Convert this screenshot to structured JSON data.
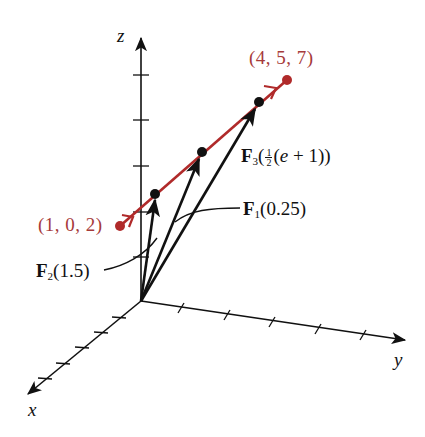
{
  "axes": {
    "x_label": "x",
    "y_label": "y",
    "z_label": "z"
  },
  "points": {
    "start": {
      "label": "(1, 0, 2)",
      "coords": [
        1,
        0,
        2
      ]
    },
    "end": {
      "label": "(4, 5, 7)",
      "coords": [
        4,
        5,
        7
      ]
    }
  },
  "vectors": [
    {
      "name": "F1",
      "symbol": "F",
      "subscript": "1",
      "arg": "(0.25)"
    },
    {
      "name": "F2",
      "symbol": "F",
      "subscript": "2",
      "arg": "(1.5)"
    },
    {
      "name": "F3",
      "symbol": "F",
      "subscript": "3",
      "arg_prefix": "(",
      "frac_num": "1",
      "frac_den": "2",
      "arg_body": "(e + 1))",
      "arg_e": "e",
      "arg_rest": " + 1))"
    }
  ],
  "colors": {
    "line": "#b02a2a",
    "label_red": "#a63a3a",
    "ink": "#111111"
  }
}
